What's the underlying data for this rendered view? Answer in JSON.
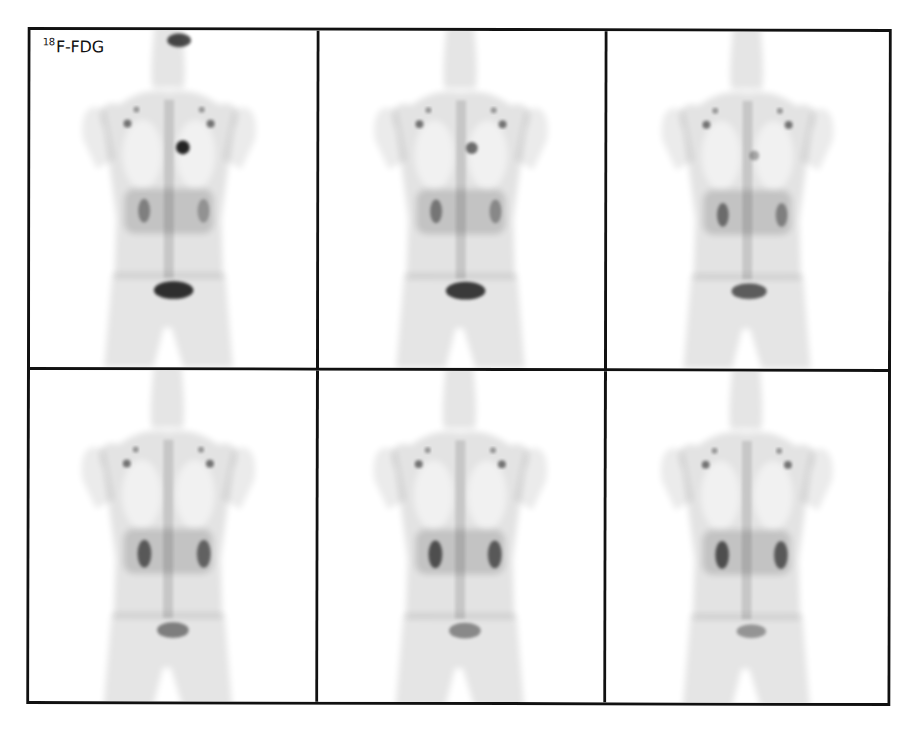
{
  "figure": {
    "type": "PET maximum intensity projection series",
    "layout": {
      "rows": 2,
      "columns": 3
    },
    "label": {
      "superscript": "18",
      "text": "F-FDG"
    },
    "panels": [
      {
        "row": 1,
        "col": 1,
        "heart_uptake": 0.85,
        "kidney_uptake": 0.35,
        "bladder_uptake": 0.8
      },
      {
        "row": 1,
        "col": 2,
        "heart_uptake": 0.55,
        "kidney_uptake": 0.4,
        "bladder_uptake": 0.75
      },
      {
        "row": 1,
        "col": 3,
        "heart_uptake": 0.3,
        "kidney_uptake": 0.45,
        "bladder_uptake": 0.6
      },
      {
        "row": 2,
        "col": 1,
        "heart_uptake": 0.15,
        "kidney_uptake": 0.55,
        "bladder_uptake": 0.45
      },
      {
        "row": 2,
        "col": 2,
        "heart_uptake": 0.12,
        "kidney_uptake": 0.6,
        "bladder_uptake": 0.4
      },
      {
        "row": 2,
        "col": 3,
        "heart_uptake": 0.1,
        "kidney_uptake": 0.6,
        "bladder_uptake": 0.35
      }
    ],
    "colors": {
      "border": "#111111",
      "background": "#ffffff",
      "tracer": "#000000"
    }
  }
}
